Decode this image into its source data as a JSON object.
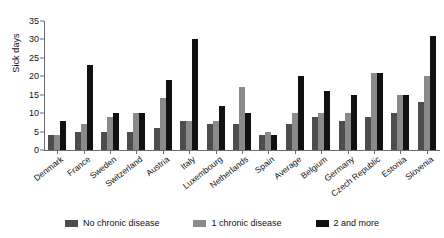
{
  "chart_data": {
    "type": "bar",
    "title": "",
    "xlabel": "",
    "ylabel": "Sick days",
    "ylim": [
      0,
      35
    ],
    "yticks": [
      0,
      5,
      10,
      15,
      20,
      25,
      30,
      35
    ],
    "grid": false,
    "legend_position": "bottom",
    "categories": [
      "Denmark",
      "France",
      "Sweden",
      "Switzerland",
      "Austria",
      "Italy",
      "Luxembourg",
      "Netherlands",
      "Spain",
      "Average",
      "Belgium",
      "Germany",
      "Czech Republic",
      "Estonia",
      "Slovenia"
    ],
    "series": [
      {
        "name": "No chronic disease",
        "color": "#4d4d4d",
        "values": [
          4,
          5,
          5,
          5,
          6,
          8,
          7,
          7,
          4,
          7,
          9,
          8,
          9,
          10,
          13
        ]
      },
      {
        "name": "1 chronic disease",
        "color": "#8a8a8a",
        "values": [
          4,
          7,
          9,
          10,
          14,
          8,
          8,
          17,
          5,
          10,
          10,
          10,
          21,
          15,
          20
        ]
      },
      {
        "name": "2 and more",
        "color": "#111111",
        "values": [
          8,
          23,
          10,
          10,
          19,
          30,
          12,
          10,
          4,
          20,
          16,
          15,
          21,
          15,
          31
        ]
      }
    ]
  },
  "legend": {
    "items": [
      {
        "label": "No chronic disease"
      },
      {
        "label": "1 chronic disease"
      },
      {
        "label": "2 and more"
      }
    ]
  }
}
